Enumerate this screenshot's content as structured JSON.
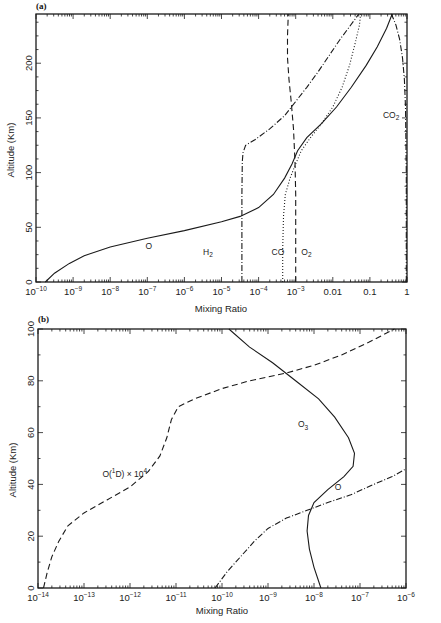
{
  "chart_data": [
    {
      "panel": "(a)",
      "type": "line",
      "xscale": "log",
      "xlabel": "Mixing Ratio",
      "ylabel": "Altitude (Km)",
      "xlim": [
        1e-10,
        1
      ],
      "ylim": [
        0,
        245
      ],
      "xticks": [
        {
          "exp": -10,
          "label": "10",
          "sup": "-10"
        },
        {
          "exp": -9,
          "label": "10",
          "sup": "-9"
        },
        {
          "exp": -8,
          "label": "10",
          "sup": "-8"
        },
        {
          "exp": -7,
          "label": "10",
          "sup": "-7"
        },
        {
          "exp": -6,
          "label": "10",
          "sup": "-6"
        },
        {
          "exp": -5,
          "label": "10",
          "sup": "-5"
        },
        {
          "exp": -4,
          "label": "10",
          "sup": "-4"
        },
        {
          "exp": -3,
          "label": "10",
          "sup": "-3"
        },
        {
          "exp": -2,
          "label": "0.01",
          "sup": ""
        },
        {
          "exp": -1,
          "label": "0.1",
          "sup": ""
        },
        {
          "exp": 0,
          "label": "1",
          "sup": ""
        }
      ],
      "yticks": [
        0,
        50,
        100,
        150,
        200
      ],
      "series": [
        {
          "name": "O",
          "label_text": "O",
          "label_sub": "",
          "style": "solid",
          "label_pos": [
            -7.05,
            30
          ],
          "points": [
            [
              -9.75,
              0
            ],
            [
              -9.5,
              8
            ],
            [
              -9.1,
              17
            ],
            [
              -8.7,
              24
            ],
            [
              -8.0,
              32
            ],
            [
              -7.0,
              40
            ],
            [
              -6.0,
              47
            ],
            [
              -5.0,
              55
            ],
            [
              -4.5,
              60
            ],
            [
              -4.0,
              68
            ],
            [
              -3.6,
              80
            ],
            [
              -3.3,
              95
            ],
            [
              -3.1,
              108
            ],
            [
              -2.95,
              120
            ],
            [
              -2.7,
              132
            ],
            [
              -2.3,
              145
            ],
            [
              -1.9,
              160
            ],
            [
              -1.5,
              178
            ],
            [
              -1.1,
              198
            ],
            [
              -0.8,
              215
            ],
            [
              -0.55,
              232
            ],
            [
              -0.4,
              245
            ]
          ]
        },
        {
          "name": "H2",
          "label_text": "H",
          "label_sub": "2",
          "style": "dashdot",
          "label_pos": [
            -5.5,
            25
          ],
          "points": [
            [
              -4.45,
              0
            ],
            [
              -4.45,
              40
            ],
            [
              -4.45,
              80
            ],
            [
              -4.44,
              110
            ],
            [
              -4.42,
              118
            ],
            [
              -4.35,
              125
            ],
            [
              -4.1,
              130
            ],
            [
              -3.7,
              140
            ],
            [
              -3.3,
              152
            ],
            [
              -3.0,
              165
            ],
            [
              -2.7,
              178
            ],
            [
              -2.4,
              192
            ],
            [
              -2.1,
              207
            ],
            [
              -1.8,
              222
            ],
            [
              -1.45,
              238
            ],
            [
              -1.3,
              245
            ]
          ]
        },
        {
          "name": "CO",
          "label_text": "CO",
          "label_sub": "",
          "style": "dotted",
          "label_pos": [
            -3.65,
            25
          ],
          "points": [
            [
              -3.35,
              0
            ],
            [
              -3.35,
              30
            ],
            [
              -3.33,
              60
            ],
            [
              -3.28,
              80
            ],
            [
              -3.15,
              95
            ],
            [
              -3.0,
              108
            ],
            [
              -2.85,
              120
            ],
            [
              -2.6,
              132
            ],
            [
              -2.3,
              145
            ],
            [
              -2.0,
              160
            ],
            [
              -1.75,
              178
            ],
            [
              -1.55,
              198
            ],
            [
              -1.4,
              218
            ],
            [
              -1.28,
              235
            ],
            [
              -1.25,
              245
            ]
          ]
        },
        {
          "name": "O2",
          "label_text": "O",
          "label_sub": "2",
          "style": "dashed",
          "label_pos": [
            -2.85,
            25
          ],
          "points": [
            [
              -3.0,
              0
            ],
            [
              -3.0,
              40
            ],
            [
              -3.0,
              80
            ],
            [
              -3.02,
              110
            ],
            [
              -3.06,
              140
            ],
            [
              -3.12,
              165
            ],
            [
              -3.18,
              185
            ],
            [
              -3.22,
              205
            ],
            [
              -3.22,
              225
            ],
            [
              -3.2,
              245
            ]
          ]
        },
        {
          "name": "CO2",
          "label_text": "CO",
          "label_sub": "2",
          "style": "dashdot",
          "label_pos": [
            -0.65,
            150
          ],
          "points": [
            [
              -0.02,
              0
            ],
            [
              -0.02,
              60
            ],
            [
              -0.02,
              100
            ],
            [
              -0.03,
              130
            ],
            [
              -0.04,
              160
            ],
            [
              -0.07,
              185
            ],
            [
              -0.12,
              205
            ],
            [
              -0.2,
              222
            ],
            [
              -0.3,
              235
            ],
            [
              -0.42,
              245
            ]
          ]
        }
      ]
    },
    {
      "panel": "(b)",
      "type": "line",
      "xscale": "log",
      "xlabel": "Mixing Ratio",
      "ylabel": "Altitude (Km)",
      "xlim": [
        1e-14,
        1e-06
      ],
      "ylim": [
        0,
        100
      ],
      "xticks": [
        {
          "exp": -14,
          "label": "10",
          "sup": "-14"
        },
        {
          "exp": -13,
          "label": "10",
          "sup": "-13"
        },
        {
          "exp": -12,
          "label": "10",
          "sup": "-12"
        },
        {
          "exp": -11,
          "label": "10",
          "sup": "-11"
        },
        {
          "exp": -10,
          "label": "10",
          "sup": "-10"
        },
        {
          "exp": -9,
          "label": "10",
          "sup": "-9"
        },
        {
          "exp": -8,
          "label": "10",
          "sup": "-8"
        },
        {
          "exp": -7,
          "label": "10",
          "sup": "-7"
        },
        {
          "exp": -6,
          "label": "10",
          "sup": "-6"
        }
      ],
      "yticks": [
        0,
        20,
        40,
        60,
        80,
        100
      ],
      "series": [
        {
          "name": "O3",
          "label_text": "O",
          "label_sub": "3",
          "style": "solid",
          "label_pos": [
            -8.35,
            62
          ],
          "points": [
            [
              -9.85,
              100
            ],
            [
              -9.4,
              93
            ],
            [
              -8.9,
              87
            ],
            [
              -8.4,
              80
            ],
            [
              -7.9,
              73
            ],
            [
              -7.55,
              66
            ],
            [
              -7.25,
              58
            ],
            [
              -7.12,
              52
            ],
            [
              -7.15,
              47
            ],
            [
              -7.35,
              43
            ],
            [
              -7.7,
              38
            ],
            [
              -8.0,
              33
            ],
            [
              -8.12,
              28
            ],
            [
              -8.15,
              22
            ],
            [
              -8.1,
              15
            ],
            [
              -8.0,
              8
            ],
            [
              -7.85,
              0
            ]
          ]
        },
        {
          "name": "O(1D) x 10^4",
          "label_text": "O(",
          "label_sup1": "1",
          "label_mid": "D) × 10",
          "label_sup": "4",
          "style": "dashed",
          "label_pos": [
            -12.6,
            43
          ],
          "points": [
            [
              -13.88,
              0
            ],
            [
              -13.8,
              6
            ],
            [
              -13.7,
              12
            ],
            [
              -13.55,
              18
            ],
            [
              -13.35,
              24
            ],
            [
              -13.0,
              29
            ],
            [
              -12.5,
              34
            ],
            [
              -12.0,
              39
            ],
            [
              -11.6,
              45
            ],
            [
              -11.35,
              51
            ],
            [
              -11.2,
              58
            ],
            [
              -11.1,
              65
            ],
            [
              -10.95,
              70
            ],
            [
              -10.6,
              73
            ],
            [
              -10.0,
              77
            ],
            [
              -9.4,
              80
            ],
            [
              -8.6,
              83
            ],
            [
              -8.0,
              86
            ],
            [
              -7.4,
              90
            ],
            [
              -6.8,
              95
            ],
            [
              -6.25,
              100
            ]
          ]
        },
        {
          "name": "O",
          "label_text": "O",
          "label_sub": "",
          "style": "dashdot",
          "label_pos": [
            -7.55,
            38
          ],
          "points": [
            [
              -10.15,
              0
            ],
            [
              -9.9,
              6
            ],
            [
              -9.6,
              12
            ],
            [
              -9.3,
              18
            ],
            [
              -9.0,
              23
            ],
            [
              -8.6,
              27
            ],
            [
              -8.15,
              30
            ],
            [
              -7.7,
              33
            ],
            [
              -7.2,
              36
            ],
            [
              -6.7,
              40
            ],
            [
              -6.3,
              43
            ],
            [
              -6.0,
              46
            ]
          ]
        }
      ]
    }
  ],
  "panels": {
    "a": {
      "label": "(a)",
      "xlabel": "Mixing Ratio",
      "ylabel": "Altitude (Km)"
    },
    "b": {
      "label": "(b)",
      "xlabel": "Mixing Ratio",
      "ylabel": "Altitude (Km)"
    }
  }
}
